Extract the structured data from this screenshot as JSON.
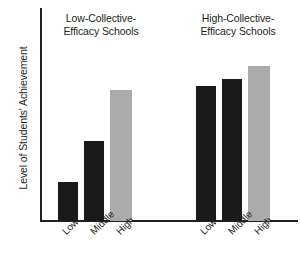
{
  "chart_data": {
    "type": "bar",
    "title": "",
    "xlabel": "",
    "ylabel": "Level of Students' Achievement",
    "ylim": [
      0,
      100
    ],
    "grid": false,
    "legend": "none",
    "axis_ticks_shown": false,
    "groups": [
      {
        "name": "Low-Collective-Efficacy Schools",
        "title_lines": "Low-Collective-\nEfficacy Schools",
        "categories": [
          "Low",
          "Middle",
          "High"
        ],
        "values": [
          21,
          43,
          71
        ],
        "colors": [
          "#1a1a1a",
          "#1a1a1a",
          "#ababab"
        ]
      },
      {
        "name": "High-Collective-Efficacy Schools",
        "title_lines": "High-Collective-\nEfficacy Schools",
        "categories": [
          "Low",
          "Middle",
          "High"
        ],
        "values": [
          73,
          77,
          84
        ],
        "colors": [
          "#1a1a1a",
          "#1a1a1a",
          "#ababab"
        ]
      }
    ],
    "series": [
      {
        "name": "Low",
        "values": [
          21,
          73
        ]
      },
      {
        "name": "Middle",
        "values": [
          43,
          77
        ]
      },
      {
        "name": "High",
        "values": [
          71,
          84
        ]
      }
    ],
    "categories": [
      "Low-Collective-Efficacy Schools",
      "High-Collective-Efficacy Schools"
    ],
    "colors": {
      "bar_dark": "#1a1a1a",
      "bar_light": "#ababab",
      "axis": "#231f20",
      "text": "#231f20",
      "background": "#ffffff"
    }
  },
  "axis": {
    "y_label": "Level of Students' Achievement"
  },
  "groups": {
    "left": {
      "title": "Low-Collective-\nEfficacy Schools",
      "ticks": [
        "Low",
        "Middle",
        "High"
      ]
    },
    "right": {
      "title": "High-Collective-\nEfficacy Schools",
      "ticks": [
        "Low",
        "Middle",
        "High"
      ]
    }
  }
}
